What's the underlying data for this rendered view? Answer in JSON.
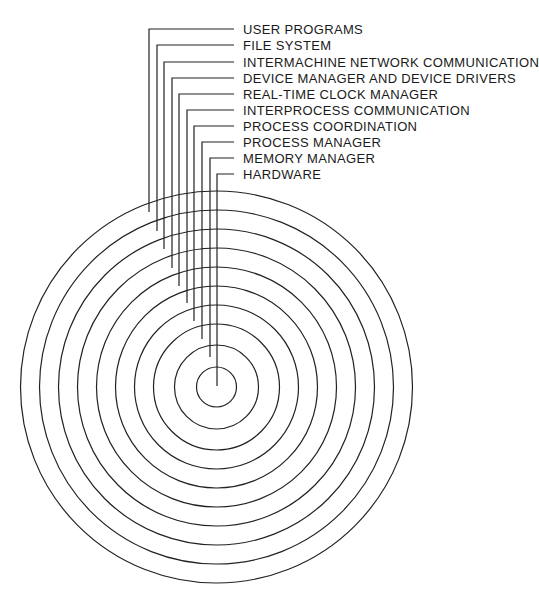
{
  "diagram": {
    "center": [
      216.5,
      387
    ],
    "line_color": "#222222",
    "layers": [
      {
        "label": "USER PROGRAMS",
        "radius": 196,
        "leader_x": 149,
        "label_y": 29,
        "line_end_y": 212
      },
      {
        "label": "FILE SYSTEM",
        "radius": 177,
        "leader_x": 157,
        "label_y": 45,
        "line_end_y": 231
      },
      {
        "label": "INTERMACHINE NETWORK COMMUNICATION",
        "radius": 158,
        "leader_x": 164,
        "label_y": 62,
        "line_end_y": 249
      },
      {
        "label": "DEVICE MANAGER AND DEVICE DRIVERS",
        "radius": 139,
        "leader_x": 172,
        "label_y": 78,
        "line_end_y": 268
      },
      {
        "label": "REAL-TIME CLOCK MANAGER",
        "radius": 120,
        "leader_x": 179,
        "label_y": 94,
        "line_end_y": 286
      },
      {
        "label": "INTERPROCESS COMMUNICATION",
        "radius": 101,
        "leader_x": 187,
        "label_y": 110,
        "line_end_y": 303
      },
      {
        "label": "PROCESS COORDINATION",
        "radius": 82,
        "leader_x": 194,
        "label_y": 126,
        "line_end_y": 321
      },
      {
        "label": "PROCESS MANAGER",
        "radius": 63,
        "leader_x": 202,
        "label_y": 142,
        "line_end_y": 339
      },
      {
        "label": "MEMORY MANAGER",
        "radius": 42,
        "leader_x": 210,
        "label_y": 158,
        "line_end_y": 357
      },
      {
        "label": "HARDWARE",
        "radius": 20,
        "leader_x": 217,
        "label_y": 174,
        "line_end_y": 386
      }
    ],
    "leader_end_x": 234,
    "label_x": 243
  }
}
